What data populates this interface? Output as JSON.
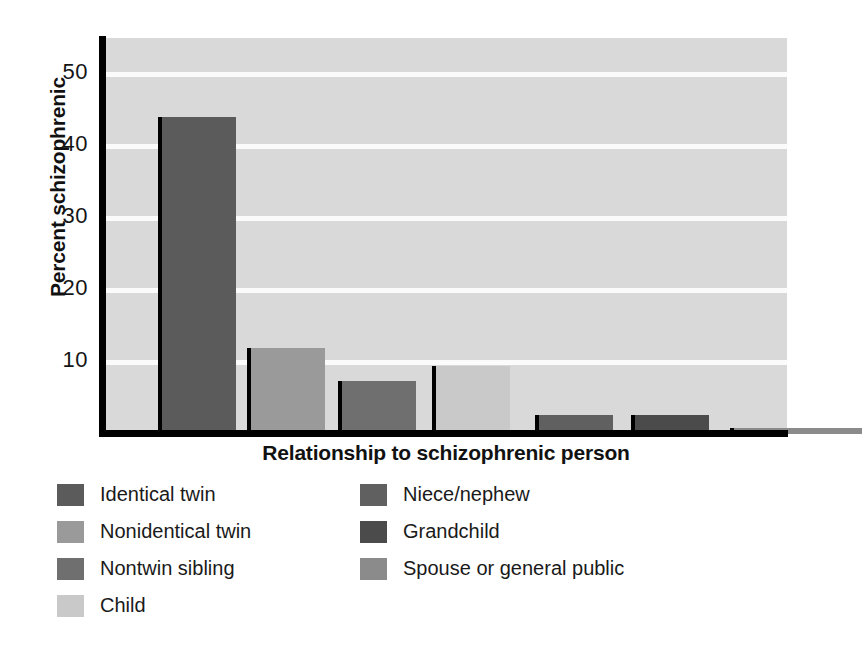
{
  "chart_data": {
    "type": "bar",
    "title": "",
    "xlabel": "Relationship to schizophrenic person",
    "ylabel": "Percent schizophrenic",
    "categories": [
      "Identical twin",
      "Nonidentical twin",
      "Nontwin sibling",
      "Child",
      "Niece/nephew",
      "Grandchild",
      "Spouse or general public"
    ],
    "values": [
      44,
      12,
      7.3,
      9.5,
      2.7,
      2.7,
      0.8
    ],
    "colors": [
      "#5b5b5b",
      "#9a9a9a",
      "#6f6f6f",
      "#c9c9c9",
      "#606060",
      "#4b4b4b",
      "#8b8b8b"
    ],
    "ylim": [
      0,
      55
    ],
    "yticks": [
      10,
      20,
      30,
      40,
      50
    ],
    "ytick_labels": [
      "10",
      "20",
      "30",
      "40",
      "50"
    ],
    "xtick_labels": [],
    "grid": true,
    "grid_color": "#fbfbfb",
    "plot_background": "#d9d9d9",
    "axis_color": "#000000",
    "legend_position": "below"
  },
  "axes": {
    "y_title": "Percent schizophrenic",
    "x_title": "Relationship to schizophrenic person",
    "y_ticks": [
      {
        "label": "10",
        "value": 10
      },
      {
        "label": "20",
        "value": 20
      },
      {
        "label": "30",
        "value": 30
      },
      {
        "label": "40",
        "value": 40
      },
      {
        "label": "50",
        "value": 50
      }
    ]
  },
  "legend": {
    "left_column": [
      {
        "label": "Identical twin",
        "color": "#5b5b5b"
      },
      {
        "label": "Nonidentical twin",
        "color": "#9a9a9a"
      },
      {
        "label": "Nontwin sibling",
        "color": "#6f6f6f"
      },
      {
        "label": "Child",
        "color": "#c9c9c9"
      }
    ],
    "right_column": [
      {
        "label": "Niece/nephew",
        "color": "#606060"
      },
      {
        "label": "Grandchild",
        "color": "#4b4b4b"
      },
      {
        "label": "Spouse or general public",
        "color": "#8b8b8b"
      }
    ]
  }
}
